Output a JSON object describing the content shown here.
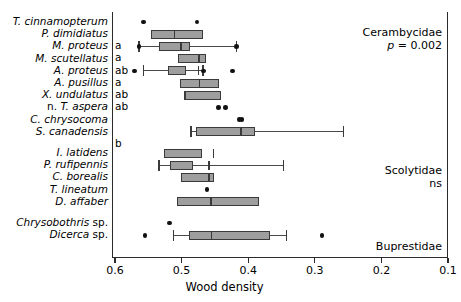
{
  "chart_data": {
    "type": "box",
    "title": "",
    "xlabel": "Wood density",
    "ylabel": "",
    "xlim": [
      0.6,
      0.1
    ],
    "x_reversed": true,
    "xticks": [
      0.6,
      0.5,
      0.4,
      0.3,
      0.2,
      0.1
    ],
    "xticklabels": [
      "0.6",
      "0.5",
      "0.4",
      "0.3",
      "0.2",
      "0.1"
    ],
    "grid": false,
    "legend": "none",
    "groups": [
      {
        "family": "Cerambycidae",
        "annotation": "p = 0.002",
        "rows": [
          {
            "label_italic": "T. cinnamopterum",
            "label_roman_prefix": "",
            "sig": "",
            "median": null,
            "q1": null,
            "q3": null,
            "wlo": null,
            "whi": null,
            "points": [
              0.557,
              0.477
            ]
          },
          {
            "label_italic": "P. dimidiatus",
            "label_roman_prefix": "",
            "sig": "a",
            "median": 0.511,
            "q1": 0.546,
            "q3": 0.468,
            "wlo": null,
            "whi": null,
            "points": []
          },
          {
            "label_italic": "M. proteus",
            "label_roman_prefix": "",
            "sig": "a",
            "median": 0.501,
            "q1": 0.534,
            "q3": 0.487,
            "wlo": 0.564,
            "whi": 0.418,
            "points": [
              0.564,
              0.418
            ]
          },
          {
            "label_italic": "M. scutellatus",
            "label_roman_prefix": "",
            "sig": "ab",
            "median": 0.474,
            "q1": 0.506,
            "q3": 0.463,
            "wlo": null,
            "whi": null,
            "points": []
          },
          {
            "label_italic": "A. proteus",
            "label_roman_prefix": "",
            "sig": "a",
            "median": 0.475,
            "q1": 0.521,
            "q3": 0.493,
            "wlo": 0.557,
            "whi": 0.468,
            "points": [
              0.571,
              0.467,
              0.424
            ]
          },
          {
            "label_italic": "A. pusillus",
            "label_roman_prefix": "",
            "sig": "ab",
            "median": 0.473,
            "q1": 0.503,
            "q3": 0.444,
            "wlo": null,
            "whi": null,
            "points": []
          },
          {
            "label_italic": "X. undulatus",
            "label_roman_prefix": "",
            "sig": "ab",
            "median": 0.494,
            "q1": 0.497,
            "q3": 0.441,
            "wlo": null,
            "whi": null,
            "points": []
          },
          {
            "label_italic": "T. aspera",
            "label_roman_prefix": "n. ",
            "sig": "",
            "median": null,
            "q1": null,
            "q3": null,
            "wlo": null,
            "whi": null,
            "points": [
              0.445,
              0.434
            ]
          },
          {
            "label_italic": "C. chrysocoma",
            "label_roman_prefix": "",
            "sig": "",
            "median": null,
            "q1": null,
            "q3": null,
            "wlo": null,
            "whi": null,
            "points": [
              0.413,
              0.409
            ]
          },
          {
            "label_italic": "S. canadensis",
            "label_roman_prefix": "",
            "sig": "b",
            "median": 0.411,
            "q1": 0.479,
            "q3": 0.39,
            "wlo": 0.486,
            "whi": 0.257,
            "points": []
          }
        ]
      },
      {
        "family": "Scolytidae",
        "annotation": "ns",
        "rows": [
          {
            "label_italic": "I. latidens",
            "label_roman_prefix": "",
            "sig": "",
            "median": 0.452,
            "q1": 0.526,
            "q3": 0.47,
            "wlo": null,
            "whi": null,
            "points": []
          },
          {
            "label_italic": "P. rufipennis",
            "label_roman_prefix": "",
            "sig": "",
            "median": 0.459,
            "q1": 0.517,
            "q3": 0.483,
            "wlo": 0.534,
            "whi": 0.347,
            "points": []
          },
          {
            "label_italic": "C. borealis",
            "label_roman_prefix": "",
            "sig": "",
            "median": 0.459,
            "q1": 0.501,
            "q3": 0.452,
            "wlo": null,
            "whi": null,
            "points": []
          },
          {
            "label_italic": "T. lineatum",
            "label_roman_prefix": "",
            "sig": "",
            "median": null,
            "q1": null,
            "q3": null,
            "wlo": null,
            "whi": null,
            "points": [
              0.462
            ]
          },
          {
            "label_italic": "D. affaber",
            "label_roman_prefix": "",
            "sig": "",
            "median": 0.456,
            "q1": 0.507,
            "q3": 0.384,
            "wlo": null,
            "whi": null,
            "points": []
          }
        ]
      },
      {
        "family": "Buprestidae",
        "annotation": "",
        "rows": [
          {
            "label_italic": "Chrysobothris",
            "label_roman_prefix": "",
            "label_roman_suffix": " sp.",
            "sig": "",
            "median": null,
            "q1": null,
            "q3": null,
            "wlo": null,
            "whi": null,
            "points": [
              0.518
            ]
          },
          {
            "label_italic": "Dicerca",
            "label_roman_prefix": "",
            "label_roman_suffix": " sp.",
            "sig": "",
            "median": 0.455,
            "q1": 0.489,
            "q3": 0.367,
            "wlo": 0.512,
            "whi": 0.342,
            "points": [
              0.555,
              0.289
            ]
          }
        ]
      }
    ]
  },
  "axis": {
    "xlabel": "Wood density",
    "ticklabels": [
      "0.6",
      "0.5",
      "0.4",
      "0.3",
      "0.2",
      "0.1"
    ]
  },
  "families": [
    {
      "name": "Cerambycidae",
      "note": "p = 0.002"
    },
    {
      "name": "Scolytidae",
      "note": "ns"
    },
    {
      "name": "Buprestidae",
      "note": ""
    }
  ],
  "colors": {
    "box_fill": "#9e9e9e",
    "box_stroke": "#3a3a3a",
    "point": "#111111",
    "axis": "#2b2b2b"
  }
}
